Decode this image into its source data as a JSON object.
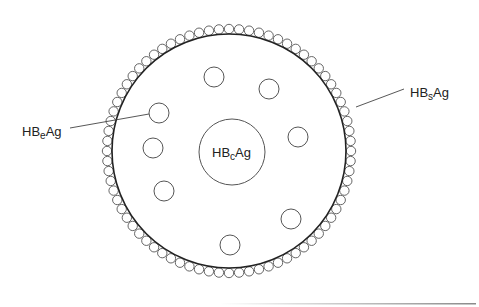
{
  "diagram": {
    "colors": {
      "stroke": "#555555",
      "outline": "#222222",
      "text": "#222222",
      "background": "#ffffff"
    },
    "envelope": {
      "cx": 229,
      "cy": 151,
      "r": 117
    },
    "surface_beads": {
      "count": 76,
      "orbit_r": 122,
      "r": 4.7
    },
    "core": {
      "cx": 232,
      "cy": 152,
      "r": 33
    },
    "inner_particles": [
      {
        "cx": 214,
        "cy": 77,
        "r": 10
      },
      {
        "cx": 269,
        "cy": 89,
        "r": 10
      },
      {
        "cx": 159,
        "cy": 113,
        "r": 10
      },
      {
        "cx": 298,
        "cy": 137,
        "r": 10
      },
      {
        "cx": 153,
        "cy": 148,
        "r": 10
      },
      {
        "cx": 164,
        "cy": 191,
        "r": 10
      },
      {
        "cx": 291,
        "cy": 219,
        "r": 10
      },
      {
        "cx": 230,
        "cy": 245,
        "r": 10
      }
    ],
    "labels": {
      "core": {
        "main": "HB",
        "sub": "c",
        "tail": "Ag",
        "full": "HBcAg"
      },
      "e_antigen": {
        "main": "HB",
        "sub": "e",
        "tail": "Ag",
        "full": "HBeAg"
      },
      "surface": {
        "main": "HB",
        "sub": "s",
        "tail": "Ag",
        "full": "HBsAg"
      }
    },
    "leaders": {
      "e_antigen": {
        "x1": 70,
        "y1": 128,
        "x2": 149,
        "y2": 114
      },
      "surface": {
        "x1": 356,
        "y1": 107,
        "x2": 404,
        "y2": 89
      }
    }
  }
}
